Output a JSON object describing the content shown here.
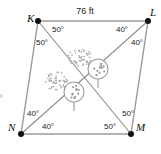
{
  "figure": {
    "type": "geometry-diagram",
    "shape_name": "parallelogram KLMN with diagonals",
    "vertices": [
      {
        "id": "K",
        "label": "K",
        "x": 38,
        "y": 21,
        "label_x": 27,
        "label_y": 22
      },
      {
        "id": "L",
        "label": "L",
        "x": 148,
        "y": 21,
        "label_x": 150,
        "label_y": 16
      },
      {
        "id": "M",
        "label": "M",
        "x": 131,
        "y": 134,
        "label_x": 136,
        "label_y": 131
      },
      {
        "id": "N",
        "label": "N",
        "x": 21,
        "y": 134,
        "label_x": 8,
        "label_y": 131
      }
    ],
    "edges": [
      {
        "from": "K",
        "to": "L"
      },
      {
        "from": "L",
        "to": "M"
      },
      {
        "from": "M",
        "to": "N"
      },
      {
        "from": "N",
        "to": "K"
      }
    ],
    "diagonals": [
      {
        "from": "K",
        "to": "M"
      },
      {
        "from": "L",
        "to": "N"
      }
    ],
    "side_labels": [
      {
        "text": "76 ft",
        "x": 85,
        "y": 14,
        "side": "KL"
      }
    ],
    "angle_labels": [
      {
        "text": "50°",
        "x": 58,
        "y": 32,
        "vertex": "K",
        "position": "K-toward-M"
      },
      {
        "text": "50°",
        "x": 42,
        "y": 45,
        "vertex": "K",
        "position": "K-toward-N"
      },
      {
        "text": "40°",
        "x": 122,
        "y": 32,
        "vertex": "L",
        "position": "L-toward-N"
      },
      {
        "text": "40°",
        "x": 137,
        "y": 45,
        "vertex": "L",
        "position": "L-toward-M"
      },
      {
        "text": "40°",
        "x": 33,
        "y": 116,
        "vertex": "N",
        "position": "N-toward-K"
      },
      {
        "text": "40°",
        "x": 48,
        "y": 129,
        "vertex": "N",
        "position": "N-toward-L"
      },
      {
        "text": "50°",
        "x": 128,
        "y": 116,
        "vertex": "M",
        "position": "M-toward-L"
      },
      {
        "text": "50°",
        "x": 110,
        "y": 129,
        "vertex": "M",
        "position": "M-toward-K"
      }
    ],
    "trees": [
      {
        "id": "tree-right",
        "canopy_x": 98,
        "canopy_y": 69,
        "canopy_r": 10,
        "trunk_bottom": 88
      },
      {
        "id": "tree-left",
        "canopy_x": 74,
        "canopy_y": 92,
        "canopy_r": 10,
        "trunk_bottom": 111
      }
    ],
    "shrubs": [
      {
        "id": "shrub-right",
        "x": 80,
        "y": 58
      },
      {
        "id": "shrub-left",
        "x": 56,
        "y": 81
      }
    ],
    "colors": {
      "line": "#9a9a9a",
      "diagonal": "#8d8d8d",
      "vertex": "#111111",
      "text": "#1a1a1a",
      "background": "#ffffff"
    }
  }
}
